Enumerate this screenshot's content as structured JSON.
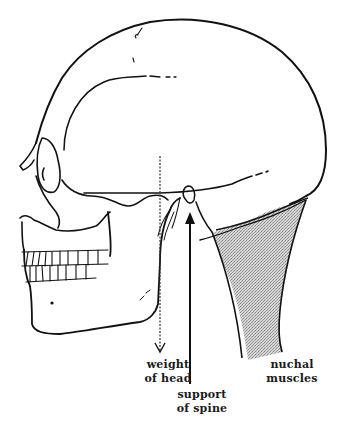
{
  "diagram": {
    "colors": {
      "line": "#111111",
      "muscle_fill": "#bdbdbd",
      "background": "#ffffff"
    },
    "elements": [
      {
        "name": "cranium",
        "kind": "outline"
      },
      {
        "name": "orbit",
        "kind": "outline"
      },
      {
        "name": "mandible",
        "kind": "outline"
      },
      {
        "name": "teeth",
        "kind": "outline"
      },
      {
        "name": "weight-of-head-arrow",
        "kind": "dashed-arrow",
        "direction": "down"
      },
      {
        "name": "support-of-spine-arrow",
        "kind": "solid-arrow",
        "direction": "up"
      },
      {
        "name": "nuchal-muscles",
        "kind": "shaded-region"
      }
    ]
  },
  "labels": {
    "weight": {
      "line1": "weight",
      "line2": "of  head"
    },
    "support": {
      "line1": "support",
      "line2": "of spine"
    },
    "nuchal": {
      "line1": "nuchal",
      "line2": "muscles"
    }
  }
}
